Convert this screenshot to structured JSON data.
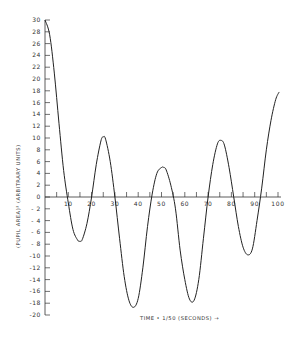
{
  "chart_data": {
    "type": "line",
    "title": "",
    "xlabel": "TIME • 1/50 (SECONDS) →",
    "ylabel": "(PUPIL AREA)² (ARBITRARY UNITS)",
    "xlim": [
      0,
      100
    ],
    "ylim": [
      -20,
      30
    ],
    "x_ticks": [
      10,
      20,
      30,
      40,
      50,
      60,
      70,
      80,
      90,
      100
    ],
    "x_tick_labels": [
      "10",
      "20",
      "30",
      "40",
      "50",
      "60",
      "70",
      "80",
      "90",
      "100"
    ],
    "x_minor_ticks": [
      5,
      15,
      25,
      35,
      45,
      55,
      65,
      75,
      85,
      95
    ],
    "y_ticks": [
      30,
      28,
      26,
      24,
      22,
      20,
      18,
      16,
      14,
      12,
      10,
      8,
      6,
      4,
      2,
      0,
      -2,
      -4,
      -6,
      -8,
      -10,
      -12,
      -14,
      -16,
      -18,
      -20
    ],
    "y_tick_labels": [
      "30",
      "28",
      "26",
      "24",
      "22",
      "20",
      "18",
      "16",
      "14",
      "12",
      "10",
      "8",
      "6",
      "4",
      "2",
      "0",
      "- 2",
      "- 4",
      "- 6",
      "- 8",
      "-10",
      "-12",
      "-14",
      "-16",
      "-18",
      "-20"
    ],
    "grid": false,
    "legend": null,
    "series": [
      {
        "name": "pupil area squared",
        "x": [
          0,
          2,
          4,
          6,
          8,
          10,
          12,
          14,
          15,
          16,
          18,
          20,
          22,
          24,
          25,
          26,
          28,
          30,
          32,
          34,
          36,
          38,
          40,
          42,
          44,
          46,
          48,
          50,
          51,
          52,
          54,
          56,
          58,
          60,
          62,
          64,
          66,
          68,
          70,
          72,
          74,
          75.5,
          77,
          79,
          81,
          83,
          85,
          87,
          89,
          91,
          93,
          95,
          97,
          99,
          100.5
        ],
        "y": [
          30,
          27.5,
          21,
          12.5,
          4.5,
          -1,
          -5.5,
          -7.3,
          -7.5,
          -7.2,
          -4.5,
          0,
          5.5,
          9.5,
          10.2,
          9.8,
          6,
          0,
          -7,
          -13.5,
          -17.5,
          -18.7,
          -17.2,
          -12,
          -5,
          0.5,
          4,
          5,
          5,
          4.6,
          2,
          -2,
          -9,
          -14,
          -17.3,
          -17.5,
          -14,
          -7,
          0,
          5.5,
          9,
          9.6,
          8.8,
          5,
          0,
          -5,
          -8.5,
          -9.8,
          -8.8,
          -4,
          1.5,
          8,
          13,
          16.5,
          17.8
        ]
      }
    ]
  }
}
